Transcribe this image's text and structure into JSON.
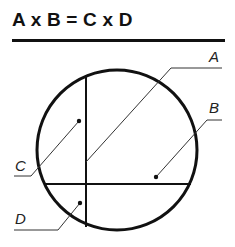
{
  "header": {
    "title": "A x B = C x D"
  },
  "diagram": {
    "labels": {
      "A": "A",
      "B": "B",
      "C": "C",
      "D": "D"
    },
    "colors": {
      "stroke": "#111111",
      "leader": "#333333",
      "label": "#222222"
    }
  }
}
